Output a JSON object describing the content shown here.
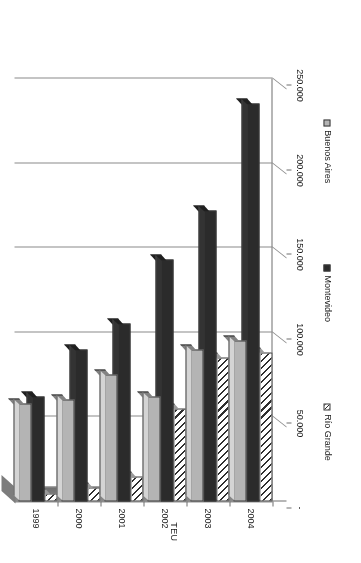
{
  "chart_data": {
    "type": "bar",
    "orientation": "vertical-rendered-rotated",
    "title": "",
    "xlabel": "",
    "ylabel": "TEU",
    "categories": [
      "1999",
      "2000",
      "2001",
      "2002",
      "2003",
      "2004"
    ],
    "series": [
      {
        "name": "Río Grande",
        "pattern": "diagonal-hatch",
        "color": "#ffffff",
        "values": [
          5000,
          8000,
          15000,
          55000,
          85000,
          88000
        ]
      },
      {
        "name": "Montevideo",
        "pattern": "solid",
        "color": "#2b2b2b",
        "values": [
          62000,
          90000,
          105000,
          143000,
          172000,
          235000
        ]
      },
      {
        "name": "Buenos Aires",
        "pattern": "solid",
        "color": "#b4b4b4",
        "values": [
          58000,
          60000,
          75000,
          62000,
          90000,
          95000
        ]
      }
    ],
    "ylim": [
      0,
      250000
    ],
    "tick_labels": [
      "-",
      "50.000",
      "100.000",
      "150.000",
      "200.000",
      "250.000"
    ],
    "tick_values": [
      0,
      50000,
      100000,
      150000,
      200000,
      250000
    ],
    "grid": true,
    "legend_position": "bottom",
    "style_3d": true
  },
  "axis": {
    "value_axis_title": "TEU",
    "zero_label": "-"
  },
  "legend": {
    "items": [
      {
        "label": "Río Grande",
        "swatch": "rio-grande-swatch"
      },
      {
        "label": "Montevideo",
        "swatch": "montevideo-swatch"
      },
      {
        "label": "Buenos Aires",
        "swatch": "buenos-aires-swatch"
      }
    ]
  },
  "caption": {
    "text": ""
  }
}
